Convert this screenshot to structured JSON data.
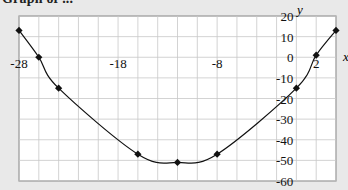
{
  "title": "Graph of ...",
  "chart_data": {
    "type": "line",
    "title": "Graph of ...",
    "xlabel": "x",
    "ylabel": "y",
    "xlim": [
      -28,
      4
    ],
    "ylim": [
      -60,
      20
    ],
    "grid": true,
    "x_grid_step": 2,
    "y_grid_step": 10,
    "x_tick_labels": [
      "-28",
      "-18",
      "-8",
      "2"
    ],
    "x_tick_values": [
      -28,
      -18,
      -8,
      2
    ],
    "y_tick_labels": [
      "20",
      "10",
      "0",
      "-10",
      "-20",
      "-30",
      "-40",
      "-50",
      "-60"
    ],
    "y_tick_values": [
      20,
      10,
      0,
      -10,
      -20,
      -30,
      -40,
      -50,
      -60
    ],
    "series": [
      {
        "name": "y",
        "marker": "diamond",
        "smooth": true,
        "x": [
          -28,
          -26,
          -24,
          -16,
          -12,
          -8,
          0,
          2,
          4
        ],
        "y": [
          13,
          0,
          -15,
          -47,
          -51,
          -47,
          -15,
          1,
          13
        ]
      }
    ]
  },
  "colors": {
    "background": "#e9e9e9",
    "plot_area": "#ffffff",
    "grid": "#c8c8c8",
    "line": "#111111"
  }
}
